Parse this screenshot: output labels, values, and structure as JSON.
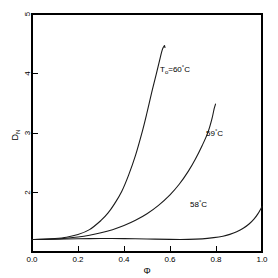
{
  "chart_data": {
    "type": "line",
    "title": "",
    "xlabel": "Φ",
    "ylabel": "D_N",
    "xlim": [
      0.0,
      1.0
    ],
    "ylim": [
      1.38,
      5.0
    ],
    "grid": false,
    "legend_position": "inline-annotations",
    "xticks": [
      "0.0",
      "0.2",
      "0.4",
      "0.6",
      "0.8",
      "1.0"
    ],
    "xtick_values": [
      0.0,
      0.2,
      0.4,
      0.6,
      0.8,
      1.0
    ],
    "yticks": [
      "2",
      "3",
      "4",
      "5"
    ],
    "ytick_values": [
      2,
      3,
      4,
      5
    ],
    "series": [
      {
        "name": "T_o=60°C",
        "label": "T",
        "label_sub": "o",
        "label_rest": "=60",
        "label_sup": "°",
        "label_unit": "C",
        "x": [
          0.0,
          0.05,
          0.1,
          0.15,
          0.2,
          0.25,
          0.3,
          0.33,
          0.36,
          0.39,
          0.42,
          0.45,
          0.48,
          0.5,
          0.52,
          0.54,
          0.555,
          0.565,
          0.572,
          0.576,
          0.578
        ],
        "y": [
          1.57,
          1.575,
          1.585,
          1.605,
          1.645,
          1.72,
          1.86,
          1.97,
          2.12,
          2.3,
          2.55,
          2.85,
          3.22,
          3.5,
          3.8,
          4.08,
          4.3,
          4.44,
          4.5,
          4.52,
          4.49
        ]
      },
      {
        "name": "59°C",
        "label": "59",
        "label_sup": "°",
        "label_unit": "C",
        "x": [
          0.0,
          0.05,
          0.1,
          0.15,
          0.2,
          0.25,
          0.3,
          0.35,
          0.4,
          0.45,
          0.5,
          0.55,
          0.6,
          0.64,
          0.68,
          0.71,
          0.74,
          0.765,
          0.782,
          0.792,
          0.798
        ],
        "y": [
          1.57,
          1.572,
          1.578,
          1.59,
          1.608,
          1.635,
          1.672,
          1.72,
          1.782,
          1.862,
          1.962,
          2.09,
          2.25,
          2.41,
          2.61,
          2.79,
          3.0,
          3.2,
          3.4,
          3.56,
          3.63
        ]
      },
      {
        "name": "58°C",
        "label": "58",
        "label_sup": "°",
        "label_unit": "C",
        "x": [
          0.0,
          0.1,
          0.2,
          0.3,
          0.4,
          0.5,
          0.6,
          0.68,
          0.74,
          0.79,
          0.83,
          0.86,
          0.89,
          0.92,
          0.945,
          0.965,
          0.982,
          1.0
        ],
        "y": [
          1.57,
          1.575,
          1.582,
          1.585,
          1.583,
          1.578,
          1.572,
          1.572,
          1.58,
          1.598,
          1.62,
          1.648,
          1.688,
          1.745,
          1.81,
          1.88,
          1.96,
          2.07
        ]
      }
    ],
    "annotations": [
      {
        "text": "T_o=60°C",
        "x_px": 160,
        "y_px": 72
      },
      {
        "text": "59°C",
        "x_px": 206,
        "y_px": 136
      },
      {
        "text": "58°C",
        "x_px": 190,
        "y_px": 207
      }
    ]
  },
  "axes": {
    "x_title": "Φ",
    "y_title_main": "D",
    "y_title_sub": "N"
  }
}
